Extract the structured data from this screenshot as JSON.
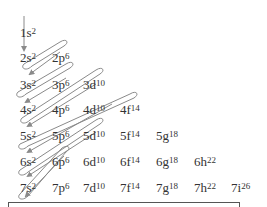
{
  "diagram": {
    "type": "aufbau-filling-order",
    "arrow_color": "#8a8a8a",
    "rows": [
      {
        "n": 1,
        "orbitals": [
          {
            "label": "1s",
            "electrons": "2"
          }
        ]
      },
      {
        "n": 2,
        "orbitals": [
          {
            "label": "2s",
            "electrons": "2"
          },
          {
            "label": "2p",
            "electrons": "6"
          }
        ]
      },
      {
        "n": 3,
        "orbitals": [
          {
            "label": "3s",
            "electrons": "2"
          },
          {
            "label": "3p",
            "electrons": "6"
          },
          {
            "label": "3d",
            "electrons": "10"
          }
        ]
      },
      {
        "n": 4,
        "orbitals": [
          {
            "label": "4s",
            "electrons": "2"
          },
          {
            "label": "4p",
            "electrons": "6"
          },
          {
            "label": "4d",
            "electrons": "10"
          },
          {
            "label": "4f",
            "electrons": "14"
          }
        ]
      },
      {
        "n": 5,
        "orbitals": [
          {
            "label": "5s",
            "electrons": "2"
          },
          {
            "label": "5p",
            "electrons": "6"
          },
          {
            "label": "5d",
            "electrons": "10"
          },
          {
            "label": "5f",
            "electrons": "14"
          },
          {
            "label": "5g",
            "electrons": "18"
          }
        ]
      },
      {
        "n": 6,
        "orbitals": [
          {
            "label": "6s",
            "electrons": "2"
          },
          {
            "label": "6p",
            "electrons": "6"
          },
          {
            "label": "6d",
            "electrons": "10"
          },
          {
            "label": "6f",
            "electrons": "14"
          },
          {
            "label": "6g",
            "electrons": "18"
          },
          {
            "label": "6h",
            "electrons": "22"
          }
        ]
      },
      {
        "n": 7,
        "orbitals": [
          {
            "label": "7s",
            "electrons": "2"
          },
          {
            "label": "7p",
            "electrons": "6"
          },
          {
            "label": "7d",
            "electrons": "10"
          },
          {
            "label": "7f",
            "electrons": "14"
          },
          {
            "label": "7g",
            "electrons": "18"
          },
          {
            "label": "7h",
            "electrons": "22"
          },
          {
            "label": "7i",
            "electrons": "26"
          }
        ]
      }
    ]
  }
}
